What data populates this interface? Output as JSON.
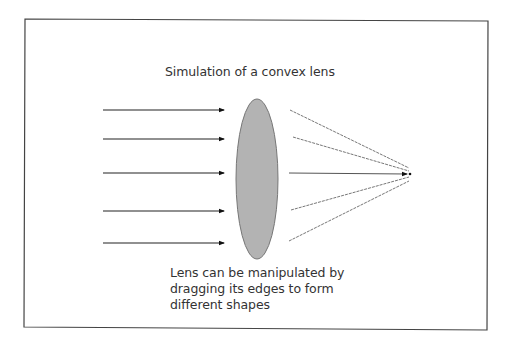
{
  "diagram": {
    "title": "Simulation of a convex lens",
    "caption_lines": [
      "Lens can be manipulated by",
      "dragging its edges to form",
      "different shapes"
    ],
    "colors": {
      "border": "#444444",
      "lens_fill": "#b3b3b3",
      "lens_stroke": "#777777",
      "incoming_ray": "#222222",
      "refracted_ray": "#777777",
      "text": "#333333"
    },
    "incoming_rays": [
      {
        "y": 110
      },
      {
        "y": 139
      },
      {
        "y": 173
      },
      {
        "y": 211
      },
      {
        "y": 243
      }
    ],
    "lens": {
      "cx": 257,
      "cy": 179,
      "rx": 21,
      "ry": 80
    },
    "focal_point": {
      "x": 410,
      "y": 174
    },
    "refracted_rays": [
      {
        "x1": 290,
        "y1": 110,
        "x2": 409,
        "y2": 168
      },
      {
        "x1": 293,
        "y1": 137,
        "x2": 409,
        "y2": 171
      },
      {
        "x1": 289,
        "y1": 173,
        "x2": 407,
        "y2": 174
      },
      {
        "x1": 291,
        "y1": 210,
        "x2": 409,
        "y2": 177
      },
      {
        "x1": 289,
        "y1": 241,
        "x2": 409,
        "y2": 181
      }
    ]
  }
}
